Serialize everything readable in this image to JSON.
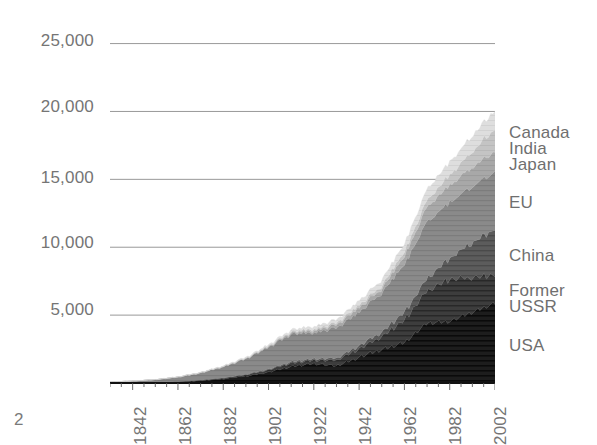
{
  "page": {
    "number": "2"
  },
  "chart_data": {
    "type": "area",
    "stacked": true,
    "title": "",
    "subtitle": "",
    "xlabel": "",
    "ylabel": "",
    "grid": "horizontal",
    "legend_position": "right",
    "xlim": [
      1832,
      2002
    ],
    "ylim": [
      0,
      26000
    ],
    "yticks": [
      "25,000",
      "20,000",
      "15,000",
      "10,000",
      "5,000"
    ],
    "ytick_values": [
      25000,
      20000,
      15000,
      10000,
      5000
    ],
    "xticks": [
      "1842",
      "1862",
      "1882",
      "1902",
      "1922",
      "1942",
      "1962",
      "1982",
      "2002"
    ],
    "xtick_values": [
      1842,
      1862,
      1882,
      1902,
      1922,
      1942,
      1962,
      1982,
      2002
    ],
    "x": [
      1832,
      1842,
      1852,
      1862,
      1872,
      1882,
      1892,
      1902,
      1912,
      1922,
      1932,
      1942,
      1952,
      1962,
      1972,
      1982,
      1992,
      2002
    ],
    "series": [
      {
        "name": "USA",
        "color": "#1d1d1d",
        "order": 1,
        "values": [
          10,
          20,
          40,
          80,
          170,
          300,
          500,
          800,
          1200,
          1450,
          1250,
          1900,
          2450,
          3000,
          4400,
          4550,
          5200,
          5900
        ]
      },
      {
        "name": "Former USSR",
        "color": "#3d3d3d",
        "order": 2,
        "values": [
          5,
          8,
          12,
          20,
          35,
          60,
          100,
          160,
          260,
          230,
          420,
          620,
          950,
          1650,
          2400,
          3100,
          2550,
          2050
        ]
      },
      {
        "name": "China",
        "color": "#5c5c5c",
        "order": 3,
        "values": [
          2,
          3,
          5,
          8,
          14,
          22,
          35,
          55,
          90,
          110,
          150,
          230,
          320,
          580,
          900,
          1550,
          2550,
          3400
        ]
      },
      {
        "name": "EU",
        "color": "#8a8a8a",
        "order": 4,
        "values": [
          60,
          110,
          190,
          320,
          520,
          800,
          1150,
          1600,
          2050,
          1900,
          2250,
          2450,
          2900,
          3500,
          4200,
          4100,
          4150,
          4250
        ]
      },
      {
        "name": "Japan",
        "color": "#a8a8a8",
        "order": 5,
        "values": [
          1,
          2,
          3,
          5,
          10,
          18,
          30,
          55,
          100,
          150,
          230,
          330,
          300,
          600,
          1100,
          1250,
          1400,
          1500
        ]
      },
      {
        "name": "India",
        "color": "#c2c2c2",
        "order": 6,
        "values": [
          1,
          2,
          4,
          7,
          12,
          20,
          32,
          50,
          80,
          110,
          140,
          190,
          230,
          330,
          500,
          750,
          1150,
          1700
        ]
      },
      {
        "name": "Canada",
        "color": "#dcdcdc",
        "order": 7,
        "values": [
          2,
          4,
          7,
          12,
          20,
          35,
          55,
          85,
          140,
          200,
          230,
          320,
          420,
          570,
          800,
          950,
          1150,
          1350
        ]
      }
    ],
    "legend_entries": [
      {
        "label": "Canada",
        "color": "#dcdcdc",
        "top": 124
      },
      {
        "label": "India",
        "color": "#c2c2c2",
        "top": 140
      },
      {
        "label": "Japan",
        "color": "#a8a8a8",
        "top": 156
      },
      {
        "label": "EU",
        "color": "#8a8a8a",
        "top": 194
      },
      {
        "label": "China",
        "color": "#5c5c5c",
        "top": 247
      },
      {
        "label": "Former",
        "color": "#3d3d3d",
        "top": 282
      },
      {
        "label": "USSR",
        "color": "#3d3d3d",
        "top": 298
      },
      {
        "label": "USA",
        "color": "#1d1d1d",
        "top": 337
      }
    ]
  }
}
